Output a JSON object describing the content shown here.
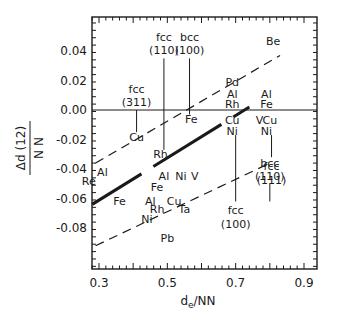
{
  "chart_data": {
    "type": "scatter",
    "title": "",
    "xlabel": "d_e/NN",
    "ylabel": "Δd(12)/NN",
    "xlim": [
      0.24,
      0.9
    ],
    "ylim": [
      -0.107,
      0.064
    ],
    "grid": false,
    "legend": null,
    "x_ticks": [
      0.3,
      0.5,
      0.7,
      0.9
    ],
    "x_tick_labels": [
      "0.3",
      "0.5",
      "0.7",
      "0.9"
    ],
    "y_ticks": [
      0.04,
      0.02,
      0.0,
      -0.02,
      -0.04,
      -0.06,
      -0.08
    ],
    "y_tick_labels": [
      "0.04",
      "0.02",
      "0.00",
      "-0.02",
      "-0.04",
      "-0.06",
      "-0.08"
    ],
    "reference_line": {
      "y": 0.0,
      "style": "solid"
    },
    "lines": [
      {
        "name": "upper bound",
        "style": "dashed",
        "x": [
          0.29,
          0.83
        ],
        "y": [
          -0.036,
          0.037
        ]
      },
      {
        "name": "fit",
        "style": "solid-thick",
        "x": [
          0.28,
          0.74
        ],
        "y": [
          -0.064,
          0.002
        ]
      },
      {
        "name": "lower bound",
        "style": "dashed",
        "x": [
          0.29,
          0.8
        ],
        "y": [
          -0.092,
          -0.036
        ]
      }
    ],
    "points": [
      {
        "label": "Be",
        "x": 0.81,
        "y": 0.047
      },
      {
        "label": "Pd",
        "x": 0.69,
        "y": 0.019
      },
      {
        "label": "Al",
        "x": 0.69,
        "y": 0.011
      },
      {
        "label": "Rh",
        "x": 0.69,
        "y": 0.004
      },
      {
        "label": "Al",
        "x": 0.79,
        "y": 0.011
      },
      {
        "label": "Fe",
        "x": 0.79,
        "y": 0.004
      },
      {
        "label": "Fe",
        "x": 0.57,
        "y": -0.006
      },
      {
        "label": "Cu",
        "x": 0.41,
        "y": -0.018
      },
      {
        "label": "Cu",
        "x": 0.69,
        "y": -0.007
      },
      {
        "label": "Ni",
        "x": 0.69,
        "y": -0.014
      },
      {
        "label": "V",
        "x": 0.77,
        "y": -0.007
      },
      {
        "label": "Cu",
        "x": 0.8,
        "y": -0.007
      },
      {
        "label": "Ni",
        "x": 0.79,
        "y": -0.014
      },
      {
        "label": "Rh",
        "x": 0.48,
        "y": -0.03
      },
      {
        "label": "Al",
        "x": 0.31,
        "y": -0.042
      },
      {
        "label": "Al",
        "x": 0.49,
        "y": -0.045
      },
      {
        "label": "Ni",
        "x": 0.54,
        "y": -0.045
      },
      {
        "label": "V",
        "x": 0.58,
        "y": -0.045
      },
      {
        "label": "Re",
        "x": 0.27,
        "y": -0.048
      },
      {
        "label": "Fe",
        "x": 0.47,
        "y": -0.052
      },
      {
        "label": "Fe",
        "x": 0.36,
        "y": -0.062
      },
      {
        "label": "Al",
        "x": 0.45,
        "y": -0.062
      },
      {
        "label": "Rh",
        "x": 0.47,
        "y": -0.067
      },
      {
        "label": "Cu",
        "x": 0.52,
        "y": -0.062
      },
      {
        "label": "Ta",
        "x": 0.55,
        "y": -0.067
      },
      {
        "label": "Ni",
        "x": 0.44,
        "y": -0.074
      },
      {
        "label": "Pb",
        "x": 0.5,
        "y": -0.087
      }
    ],
    "facet_annotations": [
      {
        "label": "fcc (311)",
        "x": 0.41,
        "y_top": 0.0,
        "y_bottom": -0.015,
        "label_pos": "above"
      },
      {
        "label": "fcc (110)",
        "x": 0.49,
        "y_top": 0.035,
        "y_bottom": -0.027,
        "label_pos": "above"
      },
      {
        "label": "bcc (100)",
        "x": 0.565,
        "y_top": 0.035,
        "y_bottom": -0.003,
        "label_pos": "above"
      },
      {
        "label": "fcc (100)",
        "x": 0.7,
        "y_top": -0.017,
        "y_bottom": -0.062,
        "label_pos": "below"
      },
      {
        "label": "fcc (111)",
        "x": 0.805,
        "y_top": -0.017,
        "y_bottom": -0.032,
        "label_pos": "below"
      },
      {
        "label": "bcc (110)",
        "x": 0.8,
        "y_top": -0.05,
        "y_bottom": -0.062,
        "label_pos": "above"
      }
    ]
  }
}
